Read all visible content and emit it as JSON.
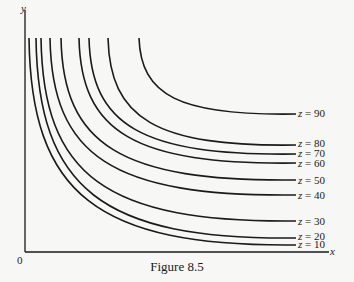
{
  "figure": {
    "caption": "Figure 8.5",
    "origin_label": "0",
    "x_axis_label": "x",
    "y_axis_label": "y"
  },
  "chart_data": {
    "type": "line",
    "title": "Figure 8.5",
    "subtitle": "Level curves (contours) z = constant",
    "xlabel": "x",
    "ylabel": "y",
    "grid": false,
    "legend": "inline labels at right end of each curve",
    "series": [
      {
        "name": "z = 10",
        "z": 10,
        "label_y_px": 244,
        "start_x_px": 29,
        "end_y_px": 245
      },
      {
        "name": "z = 20",
        "z": 20,
        "label_y_px": 236,
        "start_x_px": 36,
        "end_y_px": 238
      },
      {
        "name": "z = 30",
        "z": 30,
        "label_y_px": 221,
        "start_x_px": 41,
        "end_y_px": 221
      },
      {
        "name": "z = 40",
        "z": 40,
        "label_y_px": 195,
        "start_x_px": 50,
        "end_y_px": 195
      },
      {
        "name": "z = 50",
        "z": 50,
        "label_y_px": 180,
        "start_x_px": 61,
        "end_y_px": 180
      },
      {
        "name": "z = 60",
        "z": 60,
        "label_y_px": 163,
        "start_x_px": 79,
        "end_y_px": 163
      },
      {
        "name": "z = 70",
        "z": 70,
        "label_y_px": 153,
        "start_x_px": 89,
        "end_y_px": 154
      },
      {
        "name": "z = 80",
        "z": 80,
        "label_y_px": 143,
        "start_x_px": 108,
        "end_y_px": 145
      },
      {
        "name": "z = 90",
        "z": 90,
        "label_y_px": 113,
        "start_x_px": 139,
        "end_y_px": 114
      }
    ],
    "labels": [
      "z = 10",
      "z = 20",
      "z = 30",
      "z = 40",
      "z = 50",
      "z = 60",
      "z = 70",
      "z = 80",
      "z = 90"
    ],
    "axis_ticks": {
      "origin": "0"
    }
  },
  "style": {
    "ink": "#1a1a1a",
    "paper": "#f7f7f5"
  }
}
